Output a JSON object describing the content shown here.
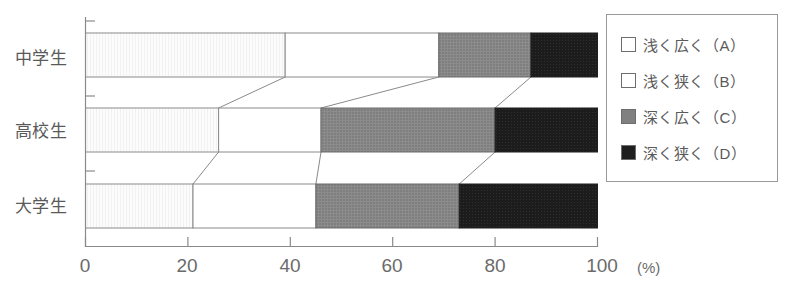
{
  "chart_data": {
    "type": "bar",
    "orientation": "horizontal",
    "stacked": true,
    "normalized": true,
    "title": "",
    "xlabel": "(%)",
    "ylabel": "",
    "xlim": [
      0,
      100
    ],
    "grid": false,
    "legend_position": "right",
    "axis_unit": "(%)",
    "categories": [
      "中学生",
      "高校生",
      "大学生"
    ],
    "xticks": [
      0,
      20,
      40,
      60,
      80,
      100
    ],
    "xticklabels": [
      "0",
      "20",
      "40",
      "60",
      "80",
      "100"
    ],
    "series": [
      {
        "name": "浅く広く（A）",
        "short": "A",
        "color": "#fdfdfd",
        "border": "#8a8a8a",
        "values": [
          39,
          26,
          21
        ]
      },
      {
        "name": "浅く狭く（B）",
        "short": "B",
        "color": "#ffffff",
        "border": "#8a8a8a",
        "values": [
          30,
          20,
          24
        ]
      },
      {
        "name": "深く広く（C）",
        "short": "C",
        "color": "#808080",
        "border": "#6d6d6d",
        "values": [
          18,
          34,
          28
        ]
      },
      {
        "name": "深く狭く（D）",
        "short": "D",
        "color": "#1f1f1f",
        "border": "#1f1f1f",
        "values": [
          13,
          20,
          27
        ]
      }
    ]
  },
  "legend": {
    "items": [
      {
        "label": "浅く広く（A）",
        "swatch": "#ffffff"
      },
      {
        "label": "浅く狭く（B）",
        "swatch": "#ffffff"
      },
      {
        "label": "深く広く（C）",
        "swatch": "#808080"
      },
      {
        "label": "深く狭く（D）",
        "swatch": "#1f1f1f"
      }
    ]
  },
  "axis": {
    "unit_label": "(%)",
    "tick_0": "0",
    "tick_20": "20",
    "tick_40": "40",
    "tick_60": "60",
    "tick_80": "80",
    "tick_100": "100"
  },
  "categories": {
    "cat_0": "中学生",
    "cat_1": "高校生",
    "cat_2": "大学生"
  },
  "colors": {
    "axis": "#8a8a8a",
    "segment_a": "#fdfdfd",
    "segment_b": "#ffffff",
    "segment_c": "#808080",
    "segment_d": "#1f1f1f",
    "text": "#5a5a5a"
  }
}
